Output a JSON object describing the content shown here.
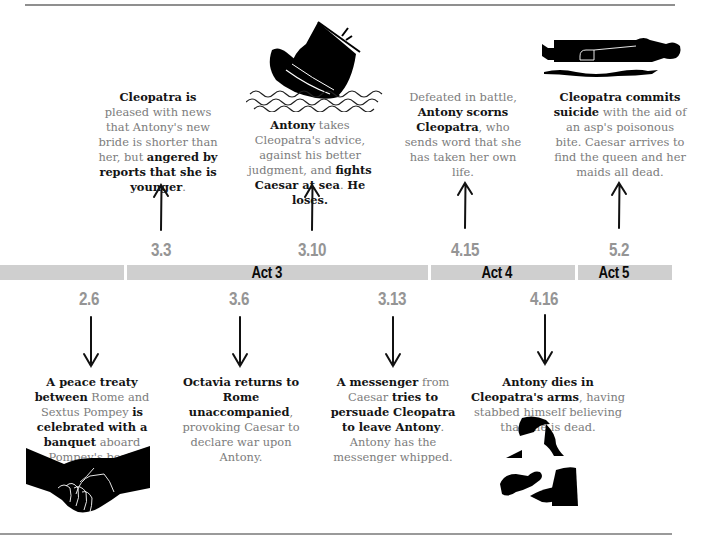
{
  "timeline": {
    "acts": [
      {
        "id": "act2",
        "label": ""
      },
      {
        "id": "act3",
        "label": "Act 3"
      },
      {
        "id": "act4",
        "label": "Act 4"
      },
      {
        "id": "act5",
        "label": "Act 5"
      }
    ],
    "bar_color": "#cfcfcf",
    "scene_color": "#959595"
  },
  "events_above": [
    {
      "scene": "3.3",
      "parts": [
        {
          "t": "Cleopatra is",
          "b": true
        },
        {
          "t": " pleased with news that Antony's new bride is shorter than her, but ",
          "b": false
        },
        {
          "t": "angered by reports that she is younger",
          "b": true
        },
        {
          "t": ".",
          "b": false
        }
      ]
    },
    {
      "scene": "3.10",
      "icon": "sinking-ship-icon",
      "parts": [
        {
          "t": "Antony",
          "b": true
        },
        {
          "t": " takes Cleopatra's advice, against his better judgment, and ",
          "b": false
        },
        {
          "t": "fights Caesar at sea",
          "b": true
        },
        {
          "t": ". ",
          "b": false
        },
        {
          "t": "He loses.",
          "b": true
        }
      ]
    },
    {
      "scene": "4.15",
      "parts": [
        {
          "t": "Defeated in battle, ",
          "b": false
        },
        {
          "t": "Antony scorns Cleopatra",
          "b": true
        },
        {
          "t": ", who sends word that she has taken her own life.",
          "b": false
        }
      ]
    },
    {
      "scene": "5.2",
      "icon": "reclining-figure-with-asp-icon",
      "parts": [
        {
          "t": "Cleopatra commits suicide",
          "b": true
        },
        {
          "t": " with the aid of an asp's poisonous bite. Caesar arrives to find the queen and her maids all dead.",
          "b": false
        }
      ]
    }
  ],
  "events_below": [
    {
      "scene": "2.6",
      "icon": "handshake-icon",
      "parts": [
        {
          "t": "A peace treaty between",
          "b": true
        },
        {
          "t": " Rome and Sextus Pompey ",
          "b": false
        },
        {
          "t": "is celebrated with a banquet",
          "b": true
        },
        {
          "t": " aboard Pompey's boat.",
          "b": false
        }
      ]
    },
    {
      "scene": "3.6",
      "parts": [
        {
          "t": "Octavia returns to Rome unaccompanied",
          "b": true
        },
        {
          "t": ", provoking Caesar to declare war upon Antony.",
          "b": false
        }
      ]
    },
    {
      "scene": "3.13",
      "parts": [
        {
          "t": "A messenger",
          "b": true
        },
        {
          "t": " from Caesar ",
          "b": false
        },
        {
          "t": "tries to persuade Cleopatra to leave Antony",
          "b": true
        },
        {
          "t": ". Antony has the messenger whipped.",
          "b": false
        }
      ]
    },
    {
      "scene": "4.16",
      "icon": "embracing-figures-icon",
      "parts": [
        {
          "t": "Antony dies in Cleopatra's arms",
          "b": true
        },
        {
          "t": ", having stabbed himself believing that she is dead.",
          "b": false
        }
      ]
    }
  ]
}
